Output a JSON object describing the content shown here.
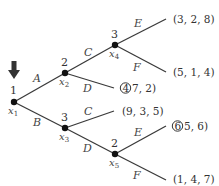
{
  "diagram": {
    "type": "game-tree",
    "start_arrow": "down-arrow",
    "nodes": {
      "x1": {
        "player": "1",
        "name": "x",
        "sub": "1"
      },
      "x2": {
        "player": "2",
        "name": "x",
        "sub": "2"
      },
      "x3": {
        "player": "3",
        "name": "x",
        "sub": "3"
      },
      "x4": {
        "player": "3",
        "name": "x",
        "sub": "4"
      },
      "x5": {
        "player": "2",
        "name": "x",
        "sub": "5"
      }
    },
    "actions": {
      "x1_up": "A",
      "x1_down": "B",
      "x2_up": "C",
      "x2_down": "D",
      "x3_up": "C",
      "x3_down": "D",
      "x4_up": "E",
      "x4_down": "F",
      "x5_up": "E",
      "x5_down": "F"
    },
    "payoffs": {
      "x4_E": "(3, 2, 8)",
      "x4_F": "(5, 1, 4)",
      "x2_D_circled": "4",
      "x2_D_rest": "7, 2)",
      "x3_C": "(9, 3, 5)",
      "x5_E_circled": "6",
      "x5_E_rest": "5, 6)",
      "x5_F": "(1, 4, 7)"
    }
  }
}
